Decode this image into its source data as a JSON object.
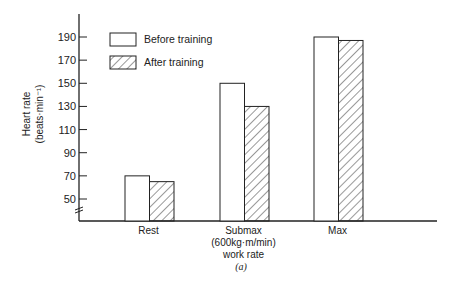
{
  "chart_data": {
    "type": "bar",
    "title": "",
    "categories": [
      "Rest",
      "Submax",
      "Max"
    ],
    "category_sublabels": {
      "Submax": [
        "(600kg·m/min)",
        "work rate"
      ]
    },
    "series": [
      {
        "name": "Before training",
        "pattern": "solid-white",
        "values": [
          70,
          150,
          190
        ]
      },
      {
        "name": "After training",
        "pattern": "diagonal-hatch",
        "values": [
          65,
          130,
          187
        ]
      }
    ],
    "xlabel": "",
    "ylabel": "Heart rate (beats·min⁻¹)",
    "ylabel_lines": [
      "Heart rate",
      "(beats·min⁻¹)"
    ],
    "yticks": [
      50,
      70,
      90,
      110,
      130,
      150,
      170,
      190
    ],
    "ylim": [
      40,
      205
    ],
    "axis_break": true,
    "grid": false,
    "legend_position": "upper-left",
    "caption": "(a)"
  },
  "colors": {
    "ink": "#222222",
    "bar_fill": "#ffffff",
    "hatch": "#333333"
  }
}
